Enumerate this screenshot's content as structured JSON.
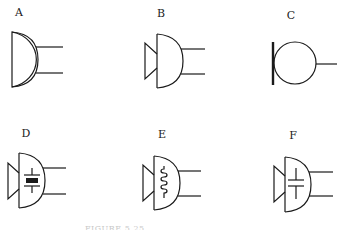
{
  "figure": {
    "caption": "FIGURE 5.25",
    "symbols": [
      {
        "label": "A",
        "type": "microphone-basic"
      },
      {
        "label": "B",
        "type": "microphone-with-horn"
      },
      {
        "label": "C",
        "type": "microphone-circle"
      },
      {
        "label": "D",
        "type": "crystal-microphone"
      },
      {
        "label": "E",
        "type": "dynamic-microphone"
      },
      {
        "label": "F",
        "type": "condenser-microphone"
      }
    ],
    "colors": {
      "line": "#1a1a1a",
      "background": "#ffffff"
    }
  }
}
